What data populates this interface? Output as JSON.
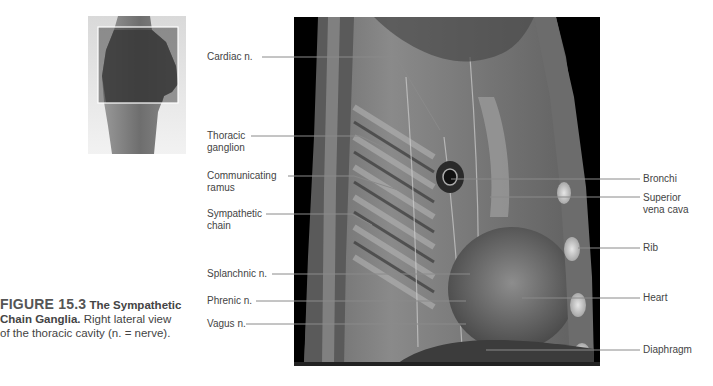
{
  "figure": {
    "number": "FIGURE 15.3",
    "title": "The Sympathetic Chain Ganglia.",
    "title_line1": "The Sympathetic",
    "title_line2": "Chain Ganglia.",
    "description_line2": "Right lateral view",
    "description_line3": "of the thoracic cavity (n. = nerve)."
  },
  "labels_left": [
    {
      "id": "cardiac-n",
      "lines": [
        "Cardiac n."
      ]
    },
    {
      "id": "thoracic-ganglion",
      "lines": [
        "Thoracic",
        "ganglion"
      ]
    },
    {
      "id": "communicating-ramus",
      "lines": [
        "Communicating",
        "ramus"
      ]
    },
    {
      "id": "sympathetic-chain",
      "lines": [
        "Sympathetic",
        "chain"
      ]
    },
    {
      "id": "splanchnic-n",
      "lines": [
        "Splanchnic n."
      ]
    },
    {
      "id": "phrenic-n",
      "lines": [
        "Phrenic n."
      ]
    },
    {
      "id": "vagus-n",
      "lines": [
        "Vagus n."
      ]
    }
  ],
  "labels_right": [
    {
      "id": "bronchi",
      "lines": [
        "Bronchi"
      ]
    },
    {
      "id": "superior-vena-cava",
      "lines": [
        "Superior",
        "vena cava"
      ]
    },
    {
      "id": "rib",
      "lines": [
        "Rib"
      ]
    },
    {
      "id": "heart",
      "lines": [
        "Heart"
      ]
    },
    {
      "id": "diaphragm",
      "lines": [
        "Diaphragm"
      ]
    }
  ],
  "colors": {
    "text": "#444444",
    "leader_line": "#8a8a8a",
    "image_background": "#000000",
    "thumb_frame": "#ffffff"
  }
}
